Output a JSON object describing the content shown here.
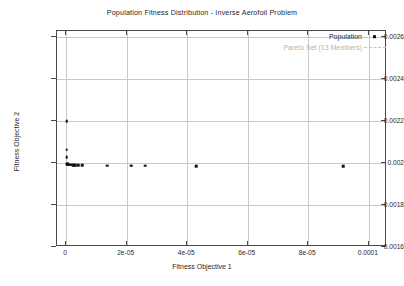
{
  "chart_data": {
    "type": "scatter",
    "title": "Population Fitness Distribution - Inverse Aerofoil Problem",
    "xlabel": "Fitness Objective 1",
    "ylabel": "Fitness Objective 2",
    "xlim": [
      -3e-06,
      0.000106
    ],
    "ylim": [
      0.0016,
      0.00263
    ],
    "grid": true,
    "legend_position": "top-right",
    "xticks": [
      0,
      2e-05,
      4e-05,
      6e-05,
      8e-05,
      0.0001
    ],
    "xticklabels": [
      "0",
      "2e-05",
      "4e-05",
      "6e-05",
      "8e-05",
      "0.0001"
    ],
    "yticks": [
      0.0016,
      0.0018,
      0.002,
      0.0022,
      0.0024,
      0.0026
    ],
    "yticklabels": [
      "0.0016",
      "0.0018",
      "0.002",
      "0.0022",
      "0.0024",
      "0.0026"
    ],
    "series": [
      {
        "name": "Population",
        "marker": "square-dot",
        "color": "#111111",
        "points": [
          [
            2e-07,
            0.0022
          ],
          [
            2e-07,
            0.002063
          ],
          [
            2e-07,
            0.002027
          ],
          [
            3e-07,
            0.001998
          ],
          [
            4e-07,
            0.001996
          ],
          [
            5e-07,
            0.001995
          ],
          [
            6e-07,
            0.001994
          ],
          [
            8e-07,
            0.001993
          ],
          [
            1.1e-06,
            0.001993
          ],
          [
            1.4e-06,
            0.001992
          ],
          [
            1.8e-06,
            0.001992
          ],
          [
            2.2e-06,
            0.001991
          ],
          [
            2.6e-06,
            0.001991
          ],
          [
            3.1e-06,
            0.00199
          ],
          [
            4e-06,
            0.00199
          ],
          [
            5.3e-06,
            0.001989
          ],
          [
            1.36e-05,
            0.001988
          ],
          [
            2.13e-05,
            0.001988
          ],
          [
            2.17e-05,
            0.001987
          ],
          [
            2.62e-05,
            0.001987
          ],
          [
            4.3e-05,
            0.001986
          ],
          [
            9.15e-05,
            0.001986
          ]
        ]
      },
      {
        "name": "Pareto Set (13 Members)",
        "marker": "dashed-line",
        "color": "#b4b4b4",
        "points": []
      }
    ]
  },
  "legend": {
    "population_label": "Population",
    "pareto_label": "Pareto Set (13 Members)"
  }
}
